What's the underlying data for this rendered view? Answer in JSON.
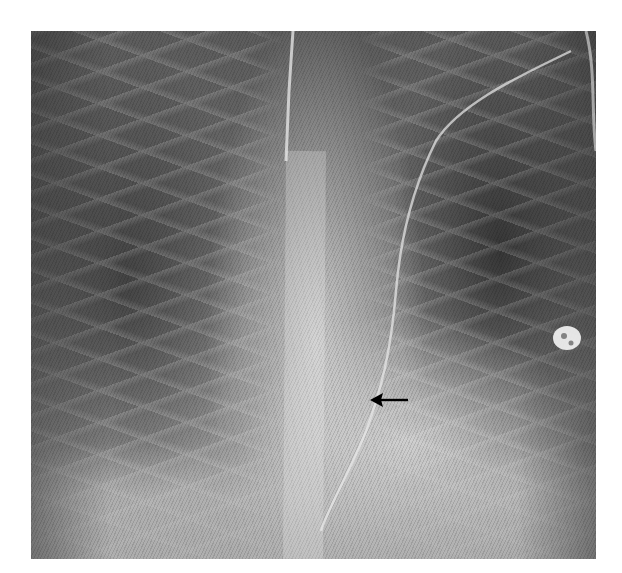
{
  "image": {
    "type": "chest radiograph",
    "view": "frontal (AP)",
    "description": "Frontal chest X-ray showing lung fields, mediastinum, heart shadow, support lines/tubes and an ECG/monitoring lead; a black arrow points leftward toward a line course near the lower mediastinum.",
    "annotations": [
      {
        "type": "arrow",
        "direction": "left",
        "color": "#000000"
      }
    ],
    "colors": {
      "background": "#ffffff",
      "film_dark": "#3a3a3a",
      "film_mid": "#7a7a7a",
      "film_bright": "#d8d8d8",
      "arrow": "#000000"
    }
  }
}
